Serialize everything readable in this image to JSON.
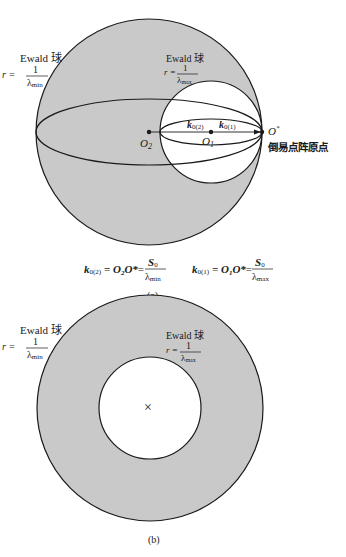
{
  "colors": {
    "shade": "#c9c9c9",
    "line": "#1a1a1a",
    "background": "#ffffff"
  },
  "panel_a": {
    "outer_sphere": {
      "title": "Ewald 球",
      "r_prefix": "r =",
      "num": "1",
      "den": "λ",
      "den_sub": "min"
    },
    "inner_sphere": {
      "title": "Ewald 球",
      "r_prefix": "r =",
      "num": "1",
      "den": "λ",
      "den_sub": "max"
    },
    "points": {
      "o2": {
        "name": "O",
        "sub": "2"
      },
      "o1": {
        "name": "O",
        "sub": "1"
      },
      "ostar": {
        "name": "O",
        "sup": "*",
        "caption": "倒易点阵原点"
      }
    },
    "vectors": {
      "k02": {
        "name": "k",
        "sub": "0(2)"
      },
      "k01": {
        "name": "k",
        "sub": "0(1)"
      }
    },
    "equations": {
      "eq1": {
        "lhs": "k",
        "lhs_sub": "0(2)",
        "mid": "= O",
        "mid_sub": "2",
        "mid2": "O*",
        "eq": "=",
        "num": "S",
        "num_sub": "0",
        "den": "λ",
        "den_sub": "min"
      },
      "eq2": {
        "lhs": "k",
        "lhs_sub": "0(1)",
        "mid": "= O",
        "mid_sub": "1",
        "mid2": "O*",
        "eq": "=",
        "num": "S",
        "num_sub": "0",
        "den": "λ",
        "den_sub": "max"
      }
    },
    "caption": "(a)"
  },
  "panel_b": {
    "outer_sphere": {
      "title": "Ewald 球",
      "r_prefix": "r =",
      "num": "1",
      "den": "λ",
      "den_sub": "min"
    },
    "inner_sphere": {
      "title": "Ewald 球",
      "r_prefix": "r =",
      "num": "1",
      "den": "λ",
      "den_sub": "max"
    },
    "center_mark": "×",
    "caption": "(b)"
  }
}
